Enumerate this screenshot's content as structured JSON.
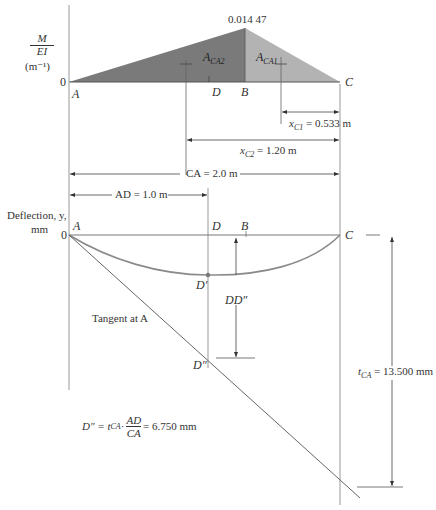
{
  "mei_diagram": {
    "y_axis_label_num": "M",
    "y_axis_label_den": "EI",
    "y_axis_unit": "(m⁻¹)",
    "origin": "0",
    "peak_value": "0.014 47",
    "points": {
      "A": "A",
      "D": "D",
      "B": "B",
      "C": "C"
    },
    "area_labels": {
      "aca2_base": "A",
      "aca2_sub": "CA2",
      "aca1_base": "A",
      "aca1_sub": "CA1"
    },
    "colors": {
      "aca2": "#7a7a7a",
      "aca1": "#b3b3b3"
    }
  },
  "dimensions": {
    "xc1_base": "x",
    "xc1_sub": "C1",
    "xc1_value": " = 0.533 m",
    "xc2_base": "x",
    "xc2_sub": "C2",
    "xc2_value": " = 1.20 m",
    "ca": "CA = 2.0 m",
    "ad": "AD = 1.0 m"
  },
  "deflection_diagram": {
    "y_axis_label_line1": "Deflection, y,",
    "y_axis_label_line2": "mm",
    "origin": "0",
    "points": {
      "A": "A",
      "D": "D",
      "B": "B",
      "C": "C",
      "D_prime": "D′",
      "D_dblprime": "D″"
    },
    "dd_label": "DD″",
    "tangent_label": "Tangent at A",
    "tca_base": "t",
    "tca_sub": "CA",
    "tca_value": " = 13.500 mm",
    "curve_color": "#8a8a8a"
  },
  "formula": {
    "lhs": "D″ = t",
    "tca_sub": "CA",
    "dot": " ·",
    "num": "AD",
    "den": "CA",
    "rhs": " = 6.750 mm"
  }
}
